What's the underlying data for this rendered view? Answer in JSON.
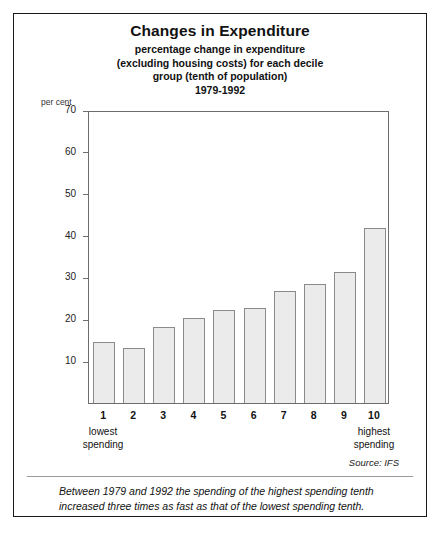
{
  "figure": {
    "title": "Changes in Expenditure",
    "subtitle_lines": [
      "percentage change in expenditure",
      "(excluding housing costs) for each decile",
      "group (tenth of population)",
      "1979-1992"
    ],
    "unit_label": "per cent",
    "source": "Source: IFS",
    "footnote": "Between 1979 and 1992 the spending of the highest spending tenth increased three times as fast as that of the lowest spending tenth.",
    "bar_fill_color": "#ebebeb",
    "bar_edge_color": "#8a8a8a",
    "frame_color": "#1a1a1a",
    "axis_color": "#6d6d6d"
  },
  "chart_data": {
    "type": "bar",
    "title": "Changes in Expenditure",
    "subtitle": "percentage change in expenditure (excluding housing costs) for each decile group (tenth of population) 1979-1992",
    "categories": [
      "1",
      "2",
      "3",
      "4",
      "5",
      "6",
      "7",
      "8",
      "9",
      "10"
    ],
    "values": [
      14.5,
      13.2,
      18.2,
      20.3,
      22.2,
      22.7,
      26.8,
      28.5,
      31.3,
      41.8
    ],
    "xlabel": "",
    "ylabel": "per cent",
    "ylim": [
      0,
      70
    ],
    "yticks": [
      10,
      20,
      30,
      40,
      50,
      60,
      70
    ],
    "ytick_labels": [
      "10",
      "20",
      "30",
      "40",
      "50",
      "60",
      "70"
    ],
    "category_notes": {
      "first": "lowest spending",
      "last": "highest spending"
    },
    "grid": false,
    "legend": "none"
  }
}
